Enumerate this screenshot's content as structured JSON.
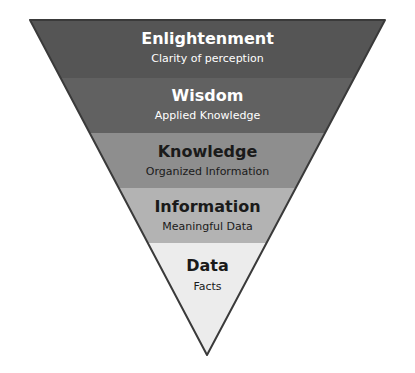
{
  "diagram": {
    "name": "DIKW inverted pyramid",
    "shape": "inverted-triangle",
    "background_color": "#ffffff",
    "outline_color": "#3a3a3a",
    "outline_width": 2,
    "geometry": {
      "top_left_x": 30,
      "top_right_x": 385,
      "top_y": 20,
      "apex_x": 207,
      "apex_y": 355
    },
    "levels": [
      {
        "id": "enlightenment",
        "title": "Enlightenment",
        "subtitle": "Clarity of perception",
        "fill": "#555555",
        "text_color": "#ffffff",
        "y_top": 20,
        "y_bottom": 78,
        "title_y": 44,
        "subtitle_y": 62,
        "title_size": 16,
        "subtitle_size": 11
      },
      {
        "id": "wisdom",
        "title": "Wisdom",
        "subtitle": "Applied Knowledge",
        "fill": "#616161",
        "text_color": "#ffffff",
        "y_top": 78,
        "y_bottom": 133,
        "title_y": 101,
        "subtitle_y": 119,
        "title_size": 16,
        "subtitle_size": 11
      },
      {
        "id": "knowledge",
        "title": "Knowledge",
        "subtitle": "Organized Information",
        "fill": "#8e8e8e",
        "text_color": "#1a1a1a",
        "y_top": 133,
        "y_bottom": 188,
        "title_y": 157,
        "subtitle_y": 175,
        "title_size": 16,
        "subtitle_size": 11
      },
      {
        "id": "information",
        "title": "Information",
        "subtitle": "Meaningful Data",
        "fill": "#b3b3b3",
        "text_color": "#1a1a1a",
        "y_top": 188,
        "y_bottom": 243,
        "title_y": 212,
        "subtitle_y": 230,
        "title_size": 16,
        "subtitle_size": 11
      },
      {
        "id": "data",
        "title": "Data",
        "subtitle": "Facts",
        "fill": "#ececec",
        "text_color": "#1a1a1a",
        "y_top": 243,
        "y_bottom": 355,
        "title_y": 271,
        "subtitle_y": 290,
        "title_size": 16,
        "subtitle_size": 11
      }
    ]
  }
}
